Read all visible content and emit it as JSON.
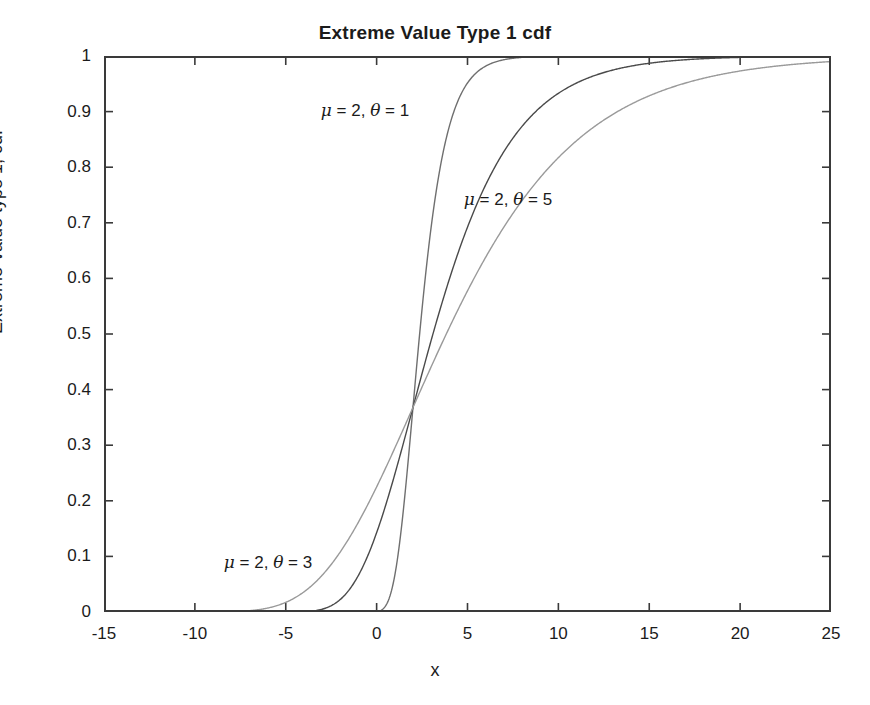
{
  "chart_data": {
    "type": "line",
    "title": "Extreme Value Type 1 cdf",
    "xlabel": "x",
    "ylabel": "Extreme-value type 1, cdf",
    "xlim": [
      -15,
      25
    ],
    "ylim": [
      0,
      1
    ],
    "xticks": [
      "-15",
      "-10",
      "-5",
      "0",
      "5",
      "10",
      "15",
      "20",
      "25"
    ],
    "xtick_values": [
      -15,
      -10,
      -5,
      0,
      5,
      10,
      15,
      20,
      25
    ],
    "yticks": [
      "0",
      "0.1",
      "0.2",
      "0.3",
      "0.4",
      "0.5",
      "0.6",
      "0.7",
      "0.8",
      "0.9",
      "1"
    ],
    "ytick_values": [
      0,
      0.1,
      0.2,
      0.3,
      0.4,
      0.5,
      0.6,
      0.7,
      0.8,
      0.9,
      1
    ],
    "grid": false,
    "legend": "none",
    "series": [
      {
        "name": "mu = 2, theta = 1",
        "mu": 2,
        "theta": 1,
        "color": "#6f6f6f",
        "linewidth": 1.4,
        "x": [
          -15,
          -12,
          -10,
          -8,
          -6,
          -5,
          -4,
          -3,
          -2.5,
          -2,
          -1.5,
          -1,
          -0.5,
          0,
          0.5,
          1,
          1.5,
          2,
          2.5,
          3,
          3.5,
          4,
          4.5,
          5,
          5.5,
          6,
          7,
          8,
          9,
          10,
          12,
          15,
          20,
          25
        ],
        "y": [
          0.0,
          0.0,
          0.0,
          0.0,
          0.0,
          0.0,
          0.0,
          0.0,
          0.0,
          0.0,
          0.0,
          0.0,
          0.0,
          0.001,
          0.003,
          0.007,
          0.017,
          0.0388,
          0.0835,
          0.1637,
          0.2845,
          0.436,
          0.5904,
          0.7224,
          0.8192,
          0.8834,
          0.9514,
          0.9786,
          0.9906,
          0.9958,
          0.9992,
          0.99996,
          1.0,
          1.0
        ]
      },
      {
        "name": "mu = 2, theta = 3",
        "mu": 2,
        "theta": 3,
        "color": "#4a4a4a",
        "linewidth": 1.4,
        "x": [
          -15,
          -13,
          -11,
          -10,
          -9,
          -8,
          -7,
          -6,
          -5,
          -4,
          -3,
          -2,
          -1,
          0,
          1,
          2,
          3,
          4,
          5,
          6,
          7,
          8,
          9,
          10,
          12,
          14,
          16,
          18,
          20,
          22,
          25
        ],
        "y": [
          0.0033,
          0.0079,
          0.0172,
          0.024,
          0.0326,
          0.0431,
          0.0557,
          0.0705,
          0.0877,
          0.1072,
          0.1291,
          0.1531,
          0.1791,
          0.2069,
          0.2361,
          0.3679,
          0.4783,
          0.5766,
          0.6598,
          0.7276,
          0.7815,
          0.8236,
          0.8562,
          0.8813,
          0.9155,
          0.936,
          0.9489,
          0.9573,
          0.9631,
          0.9671,
          0.9714
        ]
      },
      {
        "name": "mu = 2, theta = 5",
        "mu": 2,
        "theta": 5,
        "color": "#9a9a9a",
        "linewidth": 1.4,
        "x": [
          -15,
          -13,
          -11,
          -9,
          -7,
          -5,
          -3,
          -1,
          1,
          2,
          3,
          5,
          7,
          9,
          11,
          13,
          15,
          18,
          20,
          22,
          25
        ],
        "y": [
          0.0342,
          0.0516,
          0.0752,
          0.1056,
          0.143,
          0.1872,
          0.2376,
          0.2932,
          0.353,
          0.3679,
          0.4155,
          0.4791,
          0.5406,
          0.5979,
          0.6495,
          0.6949,
          0.734,
          0.7822,
          0.8073,
          0.8283,
          0.8535
        ]
      }
    ],
    "annotations": [
      {
        "text_parts": {
          "mu": "μ",
          "eq1": " = 2, ",
          "theta": "θ",
          "eq2": " = 1"
        },
        "label": "μ = 2, θ = 1",
        "x_px": 365,
        "y_px": 110,
        "for_series": "mu = 2, theta = 1"
      },
      {
        "text_parts": {
          "mu": "μ",
          "eq1": " = 2, ",
          "theta": "θ",
          "eq2": " = 5"
        },
        "label": "μ = 2, θ = 5",
        "x_px": 508,
        "y_px": 199,
        "for_series": "mu = 2, theta = 5"
      },
      {
        "text_parts": {
          "mu": "μ",
          "eq1": " = 2, ",
          "theta": "θ",
          "eq2": " = 3"
        },
        "label": "μ = 2, θ = 3",
        "x_px": 268,
        "y_px": 562,
        "for_series": "mu = 2, theta = 3"
      }
    ],
    "axis_color": "#3a3a3a",
    "background": "#ffffff"
  }
}
